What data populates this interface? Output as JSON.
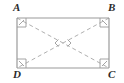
{
  "figure": {
    "kind": "rectangle-with-diagonals",
    "caption": "",
    "background_color": "#ffffff",
    "edge_color": "#9a9a9a",
    "diagonal_color": "#b0b0b0",
    "marker_color": "#9a9a9a",
    "label_color": "#2b2b2b",
    "edge_width": 1.1,
    "diagonal_width": 1,
    "diagonal_dash": "4 3",
    "rect": {
      "left": 17,
      "top": 18,
      "right": 109,
      "bottom": 68,
      "width": 92,
      "height": 50
    },
    "center": {
      "x": 63,
      "y": 43
    },
    "vertices": [
      {
        "id": "A",
        "label": "A",
        "x": 17,
        "y": 18,
        "position": "top-left",
        "right_angle": true
      },
      {
        "id": "B",
        "label": "B",
        "x": 109,
        "y": 18,
        "position": "top-right",
        "right_angle": true
      },
      {
        "id": "C",
        "label": "C",
        "x": 109,
        "y": 68,
        "position": "bottom-right",
        "right_angle": true
      },
      {
        "id": "D",
        "label": "D",
        "x": 17,
        "y": 68,
        "position": "bottom-left",
        "right_angle": true
      }
    ],
    "edges": [
      {
        "from": "A",
        "to": "B",
        "style": "solid"
      },
      {
        "from": "B",
        "to": "C",
        "style": "solid"
      },
      {
        "from": "C",
        "to": "D",
        "style": "solid"
      },
      {
        "from": "D",
        "to": "A",
        "style": "solid"
      }
    ],
    "diagonals": [
      {
        "from": "A",
        "to": "C",
        "style": "dashed"
      },
      {
        "from": "B",
        "to": "D",
        "style": "dashed"
      }
    ],
    "corner_markers": {
      "shape": "square",
      "size": 9,
      "tick": true,
      "count": 4
    },
    "center_markers": {
      "shape": "angle-arc-pair",
      "description": "two small angle marks opening left and right at diagonal intersection",
      "count": 2
    }
  }
}
